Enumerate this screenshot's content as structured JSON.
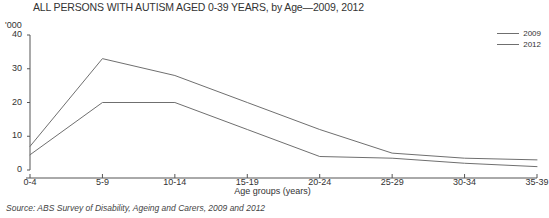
{
  "chart_data": {
    "type": "line",
    "title": "ALL PERSONS WITH AUTISM AGED 0-39 YEARS, by Age—2009, 2012",
    "xlabel": "Age groups (years)",
    "ylabel": "'000",
    "unit_label": "'000",
    "categories": [
      "0-4",
      "5-9",
      "10-14",
      "15-19",
      "20-24",
      "25-29",
      "30-34",
      "35-39"
    ],
    "series": [
      {
        "name": "2009",
        "values": [
          7,
          33,
          28,
          20,
          12,
          5,
          3.5,
          3
        ]
      },
      {
        "name": "2012",
        "values": [
          4.5,
          20,
          20,
          12,
          4,
          3.5,
          2,
          1
        ]
      }
    ],
    "ylim": [
      0,
      40
    ],
    "yticks": [
      0,
      10,
      20,
      30,
      40
    ],
    "ytick_labels": [
      "0",
      "10",
      "20",
      "30",
      "40"
    ],
    "grid": false,
    "legend_position": "top-right",
    "line_color": "#6f6f6f",
    "axis_color": "#555555"
  },
  "source": {
    "note": "Source: ABS Survey of Disability, Ageing and Carers, 2009 and 2012"
  }
}
